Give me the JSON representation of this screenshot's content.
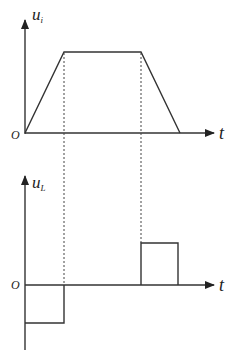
{
  "top_graph": {
    "y_label": "u",
    "y_label_sub": "i",
    "x_label": "t",
    "origin_label": "O",
    "waveform": "trapezoid"
  },
  "bottom_graph": {
    "y_label": "u",
    "y_label_sub": "L",
    "x_label": "t",
    "origin_label": "O",
    "waveform": "rectangular pulses: negative during rise, zero during flat, positive during fall"
  },
  "colors": {
    "line": "#333333",
    "background": "#ffffff"
  }
}
